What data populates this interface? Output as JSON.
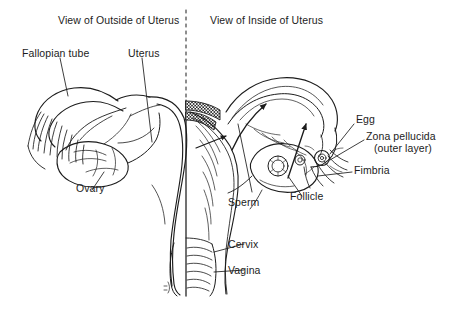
{
  "figure": {
    "kind": "anatomical-line-diagram",
    "background_color": "#ffffff",
    "ink_color": "#1c1c1c",
    "divider": {
      "style": "dashed-vertical",
      "x": 186
    }
  },
  "titles": {
    "left": "View of Outside of Uterus",
    "right": "View of Inside of Uterus"
  },
  "labels": {
    "fallopian_tube": "Fallopian tube",
    "uterus": "Uterus",
    "ovary": "Ovary",
    "sperm": "Sperm",
    "cervix": "Cervix",
    "vagina": "Vagina",
    "egg": "Egg",
    "zona_pellucida_line1": "Zona pellucida",
    "zona_pellucida_line2": "(outer layer)",
    "fimbria": "Fimbria",
    "follicle": "Follicle"
  }
}
